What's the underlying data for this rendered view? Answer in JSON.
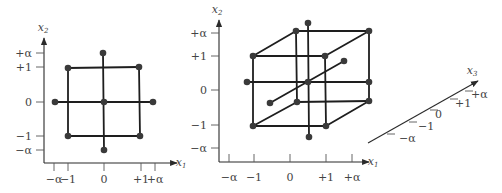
{
  "figure": {
    "panels": [
      {
        "id": "two-factor-ccd",
        "y_axis": {
          "label": "x",
          "subscript": "2",
          "line": [
            44,
            163,
            44,
            38
          ],
          "label_pos": [
            43,
            31
          ],
          "ticks": [
            {
              "label": "+α",
              "y": 53
            },
            {
              "label": "+1",
              "y": 67
            },
            {
              "label": "0",
              "y": 102
            },
            {
              "label": "−1",
              "y": 136
            },
            {
              "label": "−α",
              "y": 150
            }
          ],
          "tick_x": [
            36,
            44
          ],
          "label_x": 32
        },
        "x_axis": {
          "label": "x",
          "subscript": "1",
          "line": [
            44,
            163,
            177,
            163
          ],
          "label_pos": [
            181,
            166
          ],
          "ticks": [
            {
              "label": "−α",
              "x": 54
            },
            {
              "label": "−1",
              "x": 68
            },
            {
              "label": "0",
              "x": 104
            },
            {
              "label": "+1",
              "x": 141
            },
            {
              "label": "+α",
              "x": 155
            }
          ],
          "tick_y": [
            163,
            171
          ],
          "label_y": 183
        },
        "points": [
          [
            103,
            53
          ],
          [
            68,
            68
          ],
          [
            139,
            67
          ],
          [
            55,
            102
          ],
          [
            104,
            102
          ],
          [
            153,
            102
          ],
          [
            68,
            136
          ],
          [
            140,
            136
          ],
          [
            104,
            150
          ]
        ],
        "edges": [
          [
            68,
            68,
            139,
            67
          ],
          [
            139,
            67,
            140,
            136
          ],
          [
            140,
            136,
            68,
            136
          ],
          [
            68,
            136,
            68,
            68
          ],
          [
            55,
            102,
            153,
            102
          ],
          [
            103,
            53,
            104,
            150
          ]
        ]
      },
      {
        "id": "three-factor-ccd",
        "y_axis": {
          "label": "x",
          "subscript": "2",
          "line": [
            219,
            162,
            219,
            20
          ],
          "label_pos": [
            217,
            13
          ],
          "ticks": [
            {
              "label": "+α",
              "y": 33
            },
            {
              "label": "+1",
              "y": 56
            },
            {
              "label": "0",
              "y": 90
            },
            {
              "label": "−1",
              "y": 125
            },
            {
              "label": "−α",
              "y": 148
            }
          ],
          "tick_x": [
            211,
            219
          ],
          "label_x": 207
        },
        "x_axis": {
          "label": "x",
          "subscript": "1",
          "line": [
            219,
            162,
            369,
            162
          ],
          "label_pos": [
            373,
            165
          ],
          "ticks": [
            {
              "label": "−α",
              "x": 229
            },
            {
              "label": "−1",
              "x": 254
            },
            {
              "label": "0",
              "x": 290
            },
            {
              "label": "+1",
              "x": 326
            },
            {
              "label": "+α",
              "x": 352
            }
          ],
          "tick_y": [
            154,
            162
          ],
          "label_y": 181
        },
        "z_axis": {
          "label": "x",
          "subscript": "3",
          "line": [
            368,
            143,
            478,
            81
          ],
          "label_pos": [
            472,
            74
          ],
          "ticks": [
            {
              "label": "−α",
              "p": [
                387,
                134
              ],
              "lp": [
                399,
                139
              ]
            },
            {
              "label": "−1",
              "p": [
                409,
                122
              ],
              "lp": [
                418,
                127
              ]
            },
            {
              "label": "0",
              "p": [
                430,
                110
              ],
              "lp": [
                435,
                115
              ]
            },
            {
              "label": "+1",
              "p": [
                450,
                99
              ],
              "lp": [
                455,
                104
              ]
            },
            {
              "label": "+α",
              "p": [
                465,
                91
              ],
              "lp": [
                471,
                95
              ]
            }
          ]
        },
        "points": [
          [
            308,
            23
          ],
          [
            296,
            31
          ],
          [
            369,
            31
          ],
          [
            253,
            56
          ],
          [
            325,
            56
          ],
          [
            344,
            61
          ],
          [
            247,
            82
          ],
          [
            308,
            82
          ],
          [
            369,
            82
          ],
          [
            270,
            103
          ],
          [
            297,
            102
          ],
          [
            369,
            101
          ],
          [
            253,
            126
          ],
          [
            326,
            126
          ],
          [
            309,
            137
          ]
        ],
        "edges": [
          [
            253,
            56,
            325,
            56
          ],
          [
            325,
            56,
            326,
            126
          ],
          [
            326,
            126,
            253,
            126
          ],
          [
            253,
            126,
            253,
            56
          ],
          [
            296,
            31,
            369,
            31
          ],
          [
            369,
            31,
            369,
            101
          ],
          [
            369,
            101,
            297,
            102
          ],
          [
            297,
            102,
            296,
            31
          ],
          [
            253,
            56,
            296,
            31
          ],
          [
            325,
            56,
            369,
            31
          ],
          [
            326,
            126,
            369,
            101
          ],
          [
            253,
            126,
            297,
            102
          ],
          [
            247,
            82,
            369,
            82
          ],
          [
            308,
            23,
            309,
            137
          ],
          [
            270,
            103,
            344,
            61
          ]
        ]
      }
    ],
    "colors": {
      "ink": "#1e1e1e",
      "dot": "#3a3a3a",
      "text": "#444444",
      "background": "#ffffff"
    }
  }
}
